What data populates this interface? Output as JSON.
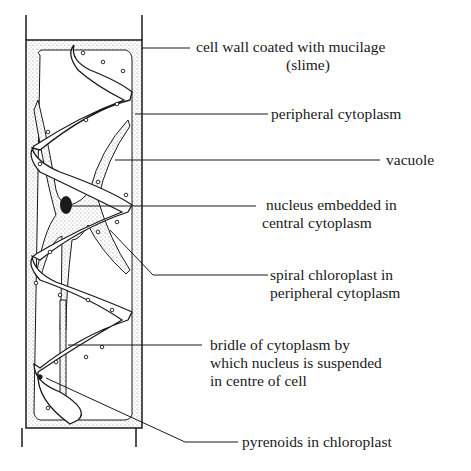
{
  "colors": {
    "ink": "#1a1a1a",
    "stipple": "#9a9a9a",
    "background": "#ffffff"
  },
  "labels": [
    {
      "id": "cell-wall",
      "lines": [
        "cell wall coated with mucilage",
        "(slime)"
      ]
    },
    {
      "id": "peripheral-cytoplasm",
      "lines": [
        "peripheral cytoplasm"
      ]
    },
    {
      "id": "vacuole",
      "lines": [
        "vacuole"
      ]
    },
    {
      "id": "nucleus",
      "lines": [
        "nucleus embedded in",
        "central cytoplasm"
      ]
    },
    {
      "id": "spiral-chloroplast",
      "lines": [
        "spiral chloroplast in",
        "peripheral cytoplasm"
      ]
    },
    {
      "id": "bridle",
      "lines": [
        "bridle of cytoplasm by",
        "which nucleus is suspended",
        "in centre of cell"
      ]
    },
    {
      "id": "pyrenoids",
      "lines": [
        "pyrenoids in chloroplast"
      ]
    }
  ]
}
